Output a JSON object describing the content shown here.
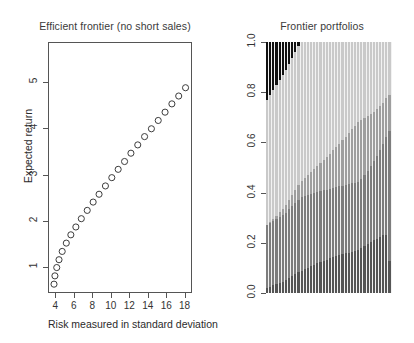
{
  "chart_data": [
    {
      "type": "scatter",
      "panel": "left",
      "title": "Efficient frontier (no short sales)",
      "xlabel": "Risk measured in standard deviation",
      "ylabel": "Expected return",
      "xlim": [
        3.2,
        18.8
      ],
      "ylim": [
        0.45,
        5.85
      ],
      "xticks": [
        4,
        6,
        8,
        10,
        12,
        14,
        16,
        18
      ],
      "yticks": [
        1,
        2,
        3,
        4,
        5
      ],
      "grid": false,
      "marker": "open-circle",
      "x": [
        3.75,
        3.85,
        4.05,
        4.3,
        4.65,
        5.1,
        5.6,
        6.15,
        6.75,
        7.4,
        8.05,
        8.7,
        9.4,
        10.1,
        10.8,
        11.5,
        12.2,
        12.95,
        13.7,
        14.45,
        15.2,
        15.95,
        16.7,
        17.45,
        18.2
      ],
      "y": [
        0.62,
        0.8,
        0.98,
        1.15,
        1.33,
        1.51,
        1.69,
        1.86,
        2.04,
        2.22,
        2.4,
        2.57,
        2.75,
        2.93,
        3.11,
        3.28,
        3.46,
        3.64,
        3.82,
        3.99,
        4.17,
        4.35,
        4.53,
        4.7,
        4.88
      ],
      "npoints": 25
    },
    {
      "type": "bar",
      "subtype": "stacked-area-weights",
      "panel": "right",
      "title": "Frontier portfolios",
      "xlabel": "",
      "ylabel": "",
      "ylim": [
        0.0,
        1.0
      ],
      "yticks": [
        "0.0",
        "0.2",
        "0.4",
        "0.6",
        "0.8",
        "1.0"
      ],
      "grid": false,
      "ncolumns": 40,
      "asset_colors": [
        "#555555",
        "#7d7d7d",
        "#9e9e9e",
        "#c9c9c9",
        "#111111"
      ],
      "series": [
        {
          "name": "asset-1",
          "color": "#555555",
          "values": [
            0.02,
            0.025,
            0.03,
            0.035,
            0.04,
            0.045,
            0.05,
            0.058,
            0.066,
            0.074,
            0.082,
            0.09,
            0.098,
            0.107,
            0.116,
            0.125,
            0.134,
            0.143,
            0.152,
            0.161,
            0.17,
            0.179,
            0.188,
            0.197,
            0.206,
            0.215,
            0.224,
            0.233,
            0.242,
            0.251,
            0.26,
            0.268,
            0.276,
            0.283,
            0.29,
            0.296,
            0.3,
            0.302,
            0.3,
            0.16
          ]
        },
        {
          "name": "asset-2",
          "color": "#7d7d7d",
          "values": [
            0.25,
            0.253,
            0.256,
            0.259,
            0.262,
            0.265,
            0.27,
            0.275,
            0.28,
            0.285,
            0.29,
            0.295,
            0.3,
            0.305,
            0.31,
            0.315,
            0.32,
            0.325,
            0.33,
            0.336,
            0.342,
            0.348,
            0.354,
            0.36,
            0.366,
            0.372,
            0.378,
            0.384,
            0.39,
            0.396,
            0.402,
            0.41,
            0.418,
            0.427,
            0.437,
            0.449,
            0.463,
            0.48,
            0.5,
            0.655
          ]
        },
        {
          "name": "asset-3",
          "color": "#9e9e9e",
          "values": [
            0.0,
            0.004,
            0.009,
            0.014,
            0.019,
            0.024,
            0.03,
            0.036,
            0.043,
            0.05,
            0.058,
            0.066,
            0.075,
            0.085,
            0.095,
            0.106,
            0.118,
            0.13,
            0.143,
            0.157,
            0.172,
            0.188,
            0.205,
            0.223,
            0.242,
            0.262,
            0.283,
            0.305,
            0.328,
            0.353,
            0.338,
            0.322,
            0.306,
            0.29,
            0.273,
            0.255,
            0.237,
            0.218,
            0.2,
            0.185
          ]
        },
        {
          "name": "asset-4",
          "color": "#c9c9c9",
          "values": [
            0.5,
            0.508,
            0.515,
            0.522,
            0.529,
            0.536,
            0.54,
            0.544,
            0.548,
            0.551,
            0.554,
            0.556,
            0.557,
            0.558,
            0.559,
            0.559,
            0.558,
            0.557,
            0.555,
            0.552,
            0.548,
            0.543,
            0.537,
            0.53,
            0.522,
            0.513,
            0.503,
            0.492,
            0.48,
            0.467,
            0.453,
            0.438,
            0.422,
            0.404,
            0.385,
            0.365,
            0.343,
            0.318,
            0.29,
            0.265
          ]
        },
        {
          "name": "asset-5",
          "color": "#111111",
          "values": [
            0.23,
            0.21,
            0.19,
            0.17,
            0.15,
            0.13,
            0.11,
            0.087,
            0.063,
            0.04,
            0.016,
            0.0,
            0.0,
            0.0,
            0.0,
            0.0,
            0.0,
            0.0,
            0.0,
            0.0,
            0.0,
            0.0,
            0.0,
            0.0,
            0.0,
            0.0,
            0.0,
            0.0,
            0.0,
            0.0,
            0.0,
            0.0,
            0.0,
            0.0,
            0.0,
            0.0,
            0.0,
            0.0,
            0.0,
            0.0
          ]
        }
      ]
    }
  ],
  "left": {
    "title": "Efficient frontier (no short sales)",
    "xlabel": "Risk measured in standard deviation",
    "ylabel": "Expected return",
    "xticks": [
      "4",
      "6",
      "8",
      "10",
      "12",
      "14",
      "16",
      "18"
    ],
    "yticks": [
      "1",
      "2",
      "3",
      "4",
      "5"
    ]
  },
  "right": {
    "title": "Frontier portfolios",
    "yticks": [
      "0.0",
      "0.2",
      "0.4",
      "0.6",
      "0.8",
      "1.0"
    ]
  }
}
